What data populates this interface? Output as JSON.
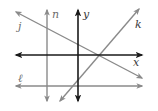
{
  "diagram": {
    "type": "coordinate-plane-lines",
    "colors": {
      "axis": "#1a1a1a",
      "line": "#8a8a8a",
      "label_gray": "#6d6d6d",
      "label_dark": "#3a3a3a",
      "background": "#ffffff"
    },
    "axes": [
      {
        "name": "x",
        "label": "x",
        "orientation": "horizontal",
        "x1": 16,
        "y1": 55,
        "x2": 142,
        "y2": 55,
        "label_x": 133,
        "label_y": 66
      },
      {
        "name": "y",
        "label": "y",
        "orientation": "vertical",
        "x1": 78,
        "y1": 10,
        "x2": 78,
        "y2": 101,
        "label_x": 83,
        "label_y": 18
      }
    ],
    "lines": [
      {
        "name": "n",
        "label": "n",
        "orientation": "vertical",
        "x1": 47,
        "y1": 10,
        "x2": 47,
        "y2": 101,
        "label_x": 52,
        "label_y": 18
      },
      {
        "name": "l",
        "label": "ℓ",
        "orientation": "horizontal",
        "x1": 16,
        "y1": 86,
        "x2": 142,
        "y2": 86,
        "label_x": 18,
        "label_y": 82
      },
      {
        "name": "j",
        "label": "j",
        "orientation": "diagonal-down",
        "x1": 16,
        "y1": 12,
        "x2": 142,
        "y2": 78,
        "label_x": 18,
        "label_y": 30
      },
      {
        "name": "k",
        "label": "k",
        "orientation": "diagonal-up",
        "x1": 60,
        "y1": 101,
        "x2": 139,
        "y2": 9,
        "label_x": 135,
        "label_y": 28
      }
    ]
  }
}
